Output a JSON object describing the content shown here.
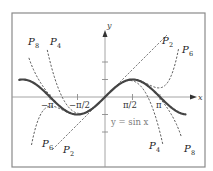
{
  "chart_data": {
    "type": "line",
    "title": "",
    "xlabel": "x",
    "ylabel": "y",
    "xlim": [
      -5.3,
      5.5
    ],
    "ylim": [
      -4.0,
      4.8
    ],
    "grid": false,
    "legend": "inline labels",
    "x_ticks": [
      {
        "value": -3.14159,
        "label": "−π"
      },
      {
        "value": -1.5708,
        "label": "−π/2"
      },
      {
        "value": 1.5708,
        "label": "π/2"
      },
      {
        "value": 3.14159,
        "label": "π"
      }
    ],
    "y_ticks": [
      -2,
      -1,
      1,
      2
    ],
    "series": [
      {
        "name": "y = sin x",
        "function": "sin",
        "x_range": [
          -4.9,
          4.6
        ],
        "style": "solid"
      },
      {
        "name": "P2",
        "function": "taylor_sin_order2",
        "terms": [
          "x"
        ],
        "x_range": [
          -3.0,
          3.6
        ],
        "style": "dashed"
      },
      {
        "name": "P4",
        "function": "taylor_sin_order4",
        "terms": [
          "x",
          "-x^3/6"
        ],
        "x_range": [
          -3.3,
          3.3
        ],
        "style": "dashed"
      },
      {
        "name": "P6",
        "function": "taylor_sin_order6",
        "terms": [
          "x",
          "-x^3/6",
          "x^5/120"
        ],
        "x_range": [
          -4.2,
          4.2
        ],
        "style": "dashed"
      },
      {
        "name": "P8",
        "function": "taylor_sin_order8",
        "terms": [
          "x",
          "-x^3/6",
          "x^5/120",
          "-x^7/5040"
        ],
        "x_range": [
          -4.35,
          4.35
        ],
        "style": "dashed"
      }
    ],
    "annotations": [
      {
        "text": "y = sin x",
        "at": [
          0.4,
          -1.4
        ]
      }
    ]
  },
  "labels": {
    "x_axis": "x",
    "y_axis": "y",
    "equation": "y = sin x",
    "tick_neg_pi": "−π",
    "tick_neg_half_pi": "−π/2",
    "tick_half_pi": "π/2",
    "tick_pi": "π",
    "poly_letter": "P",
    "p2_sub": "2",
    "p4_sub": "4",
    "p6_sub": "6",
    "p8_sub": "8"
  },
  "colors": {
    "sine": "#444444",
    "polynomials": "#333333",
    "axes": "#9a9a9a",
    "frame": "#8a8a8a",
    "equation_label": "#7a7a7a"
  }
}
